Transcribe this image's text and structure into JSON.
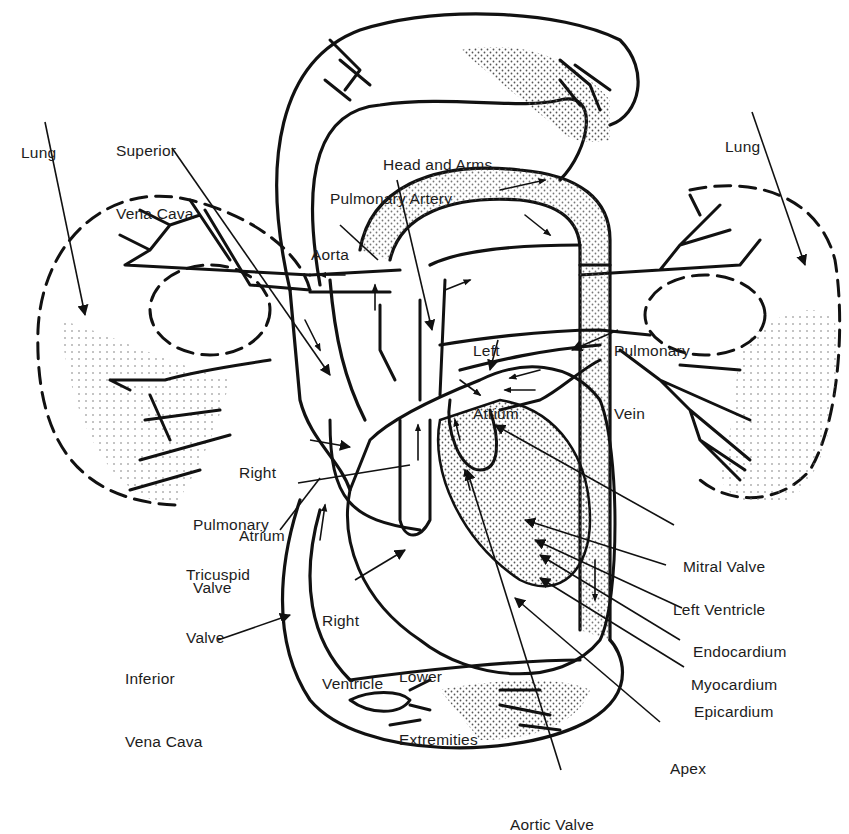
{
  "diagram": {
    "colors": {
      "ink": "#111111",
      "stipple": "#444444",
      "background": "#ffffff"
    },
    "regions": {
      "head_and_arms": "Head and Arms",
      "lower_extremities": "Lower Extremities",
      "lung_left": "Lung",
      "lung_right": "Lung"
    },
    "labels": {
      "lung_left": [
        "Lung"
      ],
      "superior_vena_cava": [
        "Superior",
        "Vena Cava"
      ],
      "head_and_arms": [
        "Head and Arms"
      ],
      "pulmonary_artery": [
        "Pulmonary Artery"
      ],
      "aorta": [
        "Aorta"
      ],
      "lung_right": [
        "Lung"
      ],
      "left_atrium": [
        "Left",
        "Atrium"
      ],
      "pulmonary_vein": [
        "Pulmonary",
        "Vein"
      ],
      "right_atrium": [
        "Right",
        "Atrium"
      ],
      "pulmonary_valve": [
        "Pulmonary",
        "Valve"
      ],
      "tricuspid_valve": [
        "Tricuspid",
        "Valve"
      ],
      "right_ventricle": [
        "Right",
        "Ventricle"
      ],
      "inferior_vena_cava": [
        "Inferior",
        "Vena Cava"
      ],
      "lower_extremities": [
        "Lower",
        "Extremities"
      ],
      "mitral_valve": [
        "Mitral Valve"
      ],
      "left_ventricle": [
        "Left Ventricle"
      ],
      "endocardium": [
        "Endocardium"
      ],
      "myocardium": [
        "Myocardium"
      ],
      "epicardium": [
        "Epicardium"
      ],
      "apex": [
        "Apex"
      ],
      "aortic_valve": [
        "Aortic Valve"
      ]
    }
  }
}
